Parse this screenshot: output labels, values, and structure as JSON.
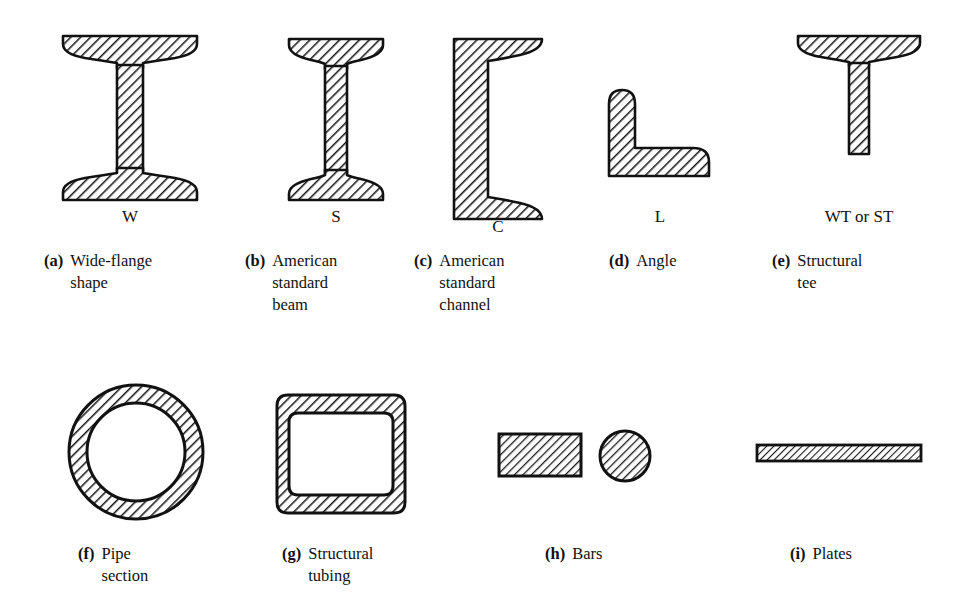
{
  "figure": {
    "background_color": "#ffffff",
    "ink_color": "#111111",
    "hatch_color": "#1a1a1a"
  },
  "items": [
    {
      "key": "wide-flange",
      "letter": "(a)",
      "caption": "Wide-flange\nshape",
      "designation": "W",
      "shape": "i-beam-wide-flange"
    },
    {
      "key": "american-standard-beam",
      "letter": "(b)",
      "caption": "American\nstandard\nbeam",
      "designation": "S",
      "shape": "i-beam-standard"
    },
    {
      "key": "american-standard-channel",
      "letter": "(c)",
      "caption": "American\nstandard\nchannel",
      "designation": "C",
      "shape": "channel"
    },
    {
      "key": "angle",
      "letter": "(d)",
      "caption": "Angle",
      "designation": "L",
      "shape": "angle"
    },
    {
      "key": "structural-tee",
      "letter": "(e)",
      "caption": "Structural\ntee",
      "designation": "WT or ST",
      "shape": "tee"
    },
    {
      "key": "pipe-section",
      "letter": "(f)",
      "caption": "Pipe\nsection",
      "designation": "",
      "shape": "annulus"
    },
    {
      "key": "structural-tubing",
      "letter": "(g)",
      "caption": "Structural\ntubing",
      "designation": "",
      "shape": "square-tube"
    },
    {
      "key": "bars",
      "letter": "(h)",
      "caption": "Bars",
      "designation": "",
      "shape": "bar-rect-and-round"
    },
    {
      "key": "plates",
      "letter": "(i)",
      "caption": "Plates",
      "designation": "",
      "shape": "plate"
    }
  ]
}
